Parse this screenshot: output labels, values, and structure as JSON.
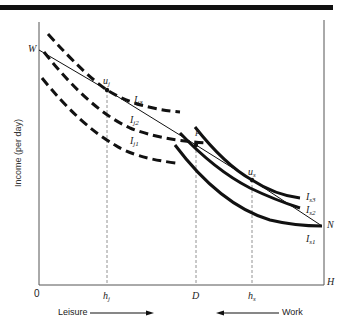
{
  "diagram": {
    "type": "economics-indifference-curves",
    "y_axis_label": "Income (per day)",
    "origin_label": "0",
    "x_end_label": "H",
    "budget_start_label": "W",
    "budget_end_label": "N",
    "x_ticks": [
      {
        "label": "h",
        "sub": "j"
      },
      {
        "label": "D",
        "sub": ""
      },
      {
        "label": "h",
        "sub": "s"
      }
    ],
    "points": [
      {
        "label": "u",
        "sub": "j"
      },
      {
        "label": "P",
        "sub": ""
      },
      {
        "label": "u",
        "sub": "s"
      }
    ],
    "curves_dashed": [
      {
        "label": "I",
        "sub": "j3"
      },
      {
        "label": "I",
        "sub": "j2"
      },
      {
        "label": "I",
        "sub": "j1"
      }
    ],
    "curves_solid": [
      {
        "label": "I",
        "sub": "s3"
      },
      {
        "label": "I",
        "sub": "s2"
      },
      {
        "label": "I",
        "sub": "s1"
      }
    ],
    "arrows": {
      "leisure": "Leisure",
      "work": "Work"
    },
    "colors": {
      "ink": "#111111",
      "axis": "#555555",
      "guide": "#777777"
    }
  }
}
